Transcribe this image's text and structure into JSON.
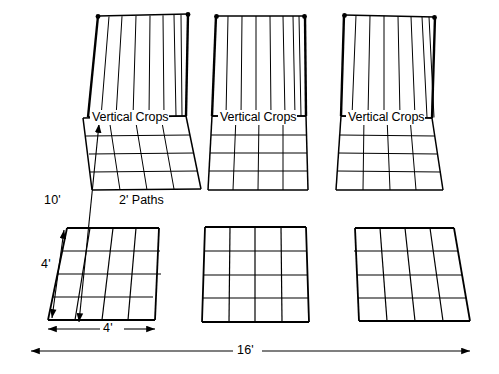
{
  "figure": {
    "type": "garden-bed-layout-diagram",
    "stroke_color": "#000000",
    "background_color": "#ffffff"
  },
  "labels": {
    "vertical_crops": "Vertical Crops",
    "paths": "2' Paths",
    "depth_total": "10'",
    "bed_depth": "4'",
    "bed_width": "4'",
    "total_width": "16'"
  },
  "beds": [
    {
      "name": "back-left-bed",
      "row": "back",
      "column": "left",
      "has_trellis": true,
      "trellis_label": "Vertical Crops",
      "grid_columns": 4,
      "grid_rows": 4,
      "quad": [
        [
          83,
          118
        ],
        [
          186,
          116
        ],
        [
          201,
          189
        ],
        [
          92,
          190
        ]
      ],
      "trellis_quad": [
        [
          98,
          16
        ],
        [
          188,
          14
        ],
        [
          186,
          116
        ],
        [
          88,
          117
        ]
      ],
      "trellis_posts": 7
    },
    {
      "name": "back-center-bed",
      "row": "back",
      "column": "center",
      "has_trellis": true,
      "trellis_label": "Vertical Crops",
      "grid_columns": 4,
      "grid_rows": 4,
      "quad": [
        [
          212,
          116
        ],
        [
          306,
          116
        ],
        [
          308,
          190
        ],
        [
          208,
          190
        ]
      ],
      "trellis_quad": [
        [
          216,
          16
        ],
        [
          305,
          16
        ],
        [
          306,
          116
        ],
        [
          212,
          116
        ]
      ],
      "trellis_posts": 7
    },
    {
      "name": "back-right-bed",
      "row": "back",
      "column": "right",
      "has_trellis": true,
      "trellis_label": "Vertical Crops",
      "grid_columns": 4,
      "grid_rows": 4,
      "quad": [
        [
          341,
          116
        ],
        [
          432,
          118
        ],
        [
          443,
          190
        ],
        [
          336,
          190
        ]
      ],
      "trellis_quad": [
        [
          344,
          15
        ],
        [
          435,
          17
        ],
        [
          432,
          118
        ],
        [
          341,
          116
        ]
      ],
      "trellis_posts": 7
    },
    {
      "name": "front-left-bed",
      "row": "front",
      "column": "left",
      "has_trellis": false,
      "grid_columns": 4,
      "grid_rows": 4,
      "quad": [
        [
          67,
          228
        ],
        [
          159,
          228
        ],
        [
          155,
          320
        ],
        [
          48,
          320
        ]
      ]
    },
    {
      "name": "front-center-bed",
      "row": "front",
      "column": "center",
      "has_trellis": false,
      "grid_columns": 4,
      "grid_rows": 4,
      "quad": [
        [
          205,
          227
        ],
        [
          306,
          227
        ],
        [
          309,
          322
        ],
        [
          202,
          322
        ]
      ]
    },
    {
      "name": "front-right-bed",
      "row": "front",
      "column": "right",
      "has_trellis": false,
      "grid_columns": 4,
      "grid_rows": 4,
      "quad": [
        [
          355,
          228
        ],
        [
          454,
          228
        ],
        [
          470,
          321
        ],
        [
          359,
          321
        ]
      ]
    }
  ],
  "dimensions": [
    {
      "name": "depth-10ft",
      "label": "10'",
      "orientation": "diagonal",
      "from": [
        79,
        322
      ],
      "to": [
        99,
        124
      ],
      "arrow_ends": "both"
    },
    {
      "name": "depth-4ft",
      "label": "4'",
      "orientation": "diagonal",
      "from": [
        52,
        318
      ],
      "to": [
        64,
        230
      ],
      "arrow_ends": "both"
    },
    {
      "name": "width-4ft",
      "label": "4'",
      "orientation": "horizontal",
      "from": [
        48,
        329
      ],
      "to": [
        155,
        329
      ],
      "arrow_ends": "both"
    },
    {
      "name": "width-16ft",
      "label": "16'",
      "orientation": "horizontal",
      "from": [
        31,
        351
      ],
      "to": [
        470,
        351
      ],
      "arrow_ends": "both"
    }
  ]
}
